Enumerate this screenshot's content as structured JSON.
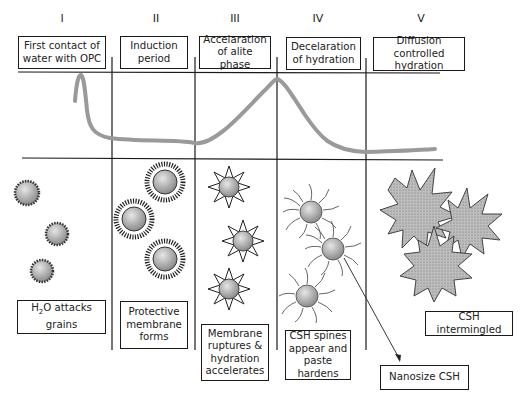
{
  "diagram": {
    "stages": [
      {
        "numeral": "I",
        "header": [
          "First contact of",
          "water with OPC"
        ],
        "caption": [
          "H₂O attacks",
          "grains"
        ],
        "particle_style": "rough-coated grain"
      },
      {
        "numeral": "II",
        "header": [
          "Induction",
          "period"
        ],
        "caption": [
          "Protective",
          "membrane",
          "forms"
        ],
        "particle_style": "dense spiky membrane"
      },
      {
        "numeral": "III",
        "header": [
          "Accelaration",
          "of alite phase"
        ],
        "caption": [
          "Membrane",
          "ruptures &",
          "hydration",
          "accelerates"
        ],
        "particle_style": "star with ruptured points"
      },
      {
        "numeral": "IV",
        "header": [
          "Decelaration",
          "of hydration"
        ],
        "caption": [
          "CSH spines",
          "appear and",
          "paste hardens"
        ],
        "particle_style": "grain with CSH spines"
      },
      {
        "numeral": "V",
        "header": [
          "Diffusion controlled",
          "hydration"
        ],
        "caption": [
          "CSH intermingled"
        ],
        "particle_style": "intermingled star clusters"
      }
    ],
    "callout": {
      "label": "Nanosize CSH",
      "points_to": "CSH spine"
    },
    "curve": {
      "description": "Heat evolution rate curve",
      "color": "#9a9a9a",
      "features": [
        "initial sharp peak in stage I",
        "dormant plateau in stage II",
        "main peak at III/IV boundary",
        "decay to low steady level in V"
      ]
    },
    "colors": {
      "line": "#1a1a1a",
      "curve": "#9a9a9a",
      "particle_fill": "#a8a8a8",
      "cluster_fill": "#b4b4b4"
    }
  }
}
